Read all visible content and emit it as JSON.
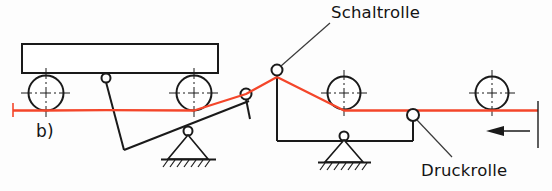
{
  "figure": {
    "part_label": "b)",
    "kind": "mechanical-schematic",
    "line_color_material": "#f4462a",
    "line_color_structure": "#1a1a1a",
    "background": "#fdfdfd"
  },
  "labels": {
    "schaltrolle": "Schaltrolle",
    "druckrolle": "Druckrolle"
  },
  "geometry": {
    "cart": {
      "body": {
        "x": 22,
        "y": 44,
        "width": 196,
        "height": 29
      },
      "wheels": [
        {
          "cx": 46,
          "cy": 93,
          "r": 17.5
        },
        {
          "cx": 194,
          "cy": 93,
          "r": 17.5
        }
      ]
    },
    "left_lever": {
      "top_pin": {
        "cx": 106,
        "cy": 78,
        "r": 4.5
      },
      "link_down": {
        "x1": 106,
        "y1": 82.5,
        "x2": 124,
        "y2": 150
      },
      "beam": {
        "x1": 124,
        "y1": 150,
        "x2": 248,
        "y2": 102
      },
      "pivot": {
        "cx": 188,
        "cy": 131,
        "r": 4.5
      },
      "support_triangle": {
        "apex_x": 188,
        "apex_y": 135,
        "left_x": 167,
        "right_x": 209,
        "base_y": 160
      },
      "ground_line": {
        "x1": 161,
        "y1": 160,
        "x2": 215,
        "y2": 160
      },
      "roller": {
        "cx": 246,
        "cy": 94,
        "r": 5.5
      },
      "roller_stem": {
        "x1": 246,
        "y1": 99,
        "x2": 249,
        "y2": 118
      }
    },
    "right_lever": {
      "schaltrolle_roller": {
        "cx": 277,
        "cy": 70,
        "r": 5.5
      },
      "schaltrolle_stem": {
        "x1": 277,
        "y1": 75.5,
        "x2": 277,
        "y2": 141
      },
      "beam": {
        "x1": 277,
        "y1": 141,
        "x2": 413,
        "y2": 141
      },
      "pivot": {
        "cx": 344,
        "cy": 136,
        "r": 4.5
      },
      "support_triangle": {
        "apex_x": 344,
        "apex_y": 140,
        "left_x": 324,
        "right_x": 364,
        "base_y": 163
      },
      "ground_line": {
        "x1": 318,
        "y1": 163,
        "x2": 371,
        "y2": 163
      },
      "druckrolle_roller": {
        "cx": 413,
        "cy": 115,
        "r": 6
      },
      "druckrolle_stem": {
        "x1": 413,
        "y1": 121,
        "x2": 413,
        "y2": 141
      }
    },
    "guide_wheels": [
      {
        "cx": 344,
        "cy": 93,
        "r": 16.5
      },
      {
        "cx": 492,
        "cy": 93,
        "r": 16.5
      }
    ],
    "material_path": "M 13 110 L 46 110.5 L 106 110 L 194 110.5 L 246 94 L 277 77 L 344 110 L 413 110.5 L 492 110.5 L 538 110.5",
    "material_start_tick": {
      "x": 13,
      "y1": 103,
      "y2": 117
    },
    "end_reference_line": {
      "x": 538,
      "y1": 103,
      "y2": 148
    },
    "direction_arrow": {
      "tail_x": 530,
      "tip_x": 486,
      "y": 131,
      "label": ""
    },
    "leader_schaltrolle": {
      "x1": 277,
      "y1": 66,
      "x2": 330,
      "y2": 22
    },
    "leader_druckrolle": {
      "x1": 417,
      "y1": 120,
      "x2": 452,
      "y2": 157
    }
  }
}
